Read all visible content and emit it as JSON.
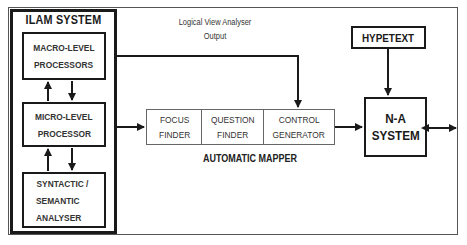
{
  "diagram": {
    "ilam_system": {
      "title": "ILAM SYSTEM",
      "macro": {
        "line1": "MACRO-LEVEL",
        "line2": "PROCESSORS"
      },
      "micro": {
        "line1": "MICRO-LEVEL",
        "line2": "PROCESSOR"
      },
      "syntactic": {
        "line1": "SYNTACTIC /",
        "line2": "SEMANTIC",
        "line3": "ANALYSER"
      }
    },
    "logical_view": {
      "line1": "Logical View Analyser",
      "line2": "Output"
    },
    "automatic_mapper": {
      "label": "AUTOMATIC MAPPER",
      "cells": [
        {
          "line1": "FOCUS",
          "line2": "FINDER"
        },
        {
          "line1": "QUESTION",
          "line2": "FINDER"
        },
        {
          "line1": "CONTROL",
          "line2": "GENERATOR"
        }
      ]
    },
    "hypetext": {
      "label": "HYPETEXT"
    },
    "na_system": {
      "line1": "N-A",
      "line2": "SYSTEM"
    },
    "colors": {
      "stroke": "#1a1a1a",
      "thin_stroke": "#666666",
      "background": "#ffffff"
    }
  }
}
